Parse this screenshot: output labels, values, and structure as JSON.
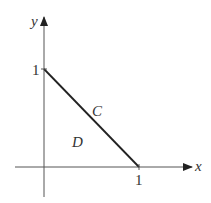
{
  "diagram": {
    "axes": {
      "x_label": "x",
      "y_label": "y",
      "x_tick_label": "1",
      "y_tick_label": "1"
    },
    "curve_label": "C",
    "region_label": "D",
    "colors": {
      "line": "#222222",
      "axis": "#555555",
      "text": "#333333"
    }
  }
}
